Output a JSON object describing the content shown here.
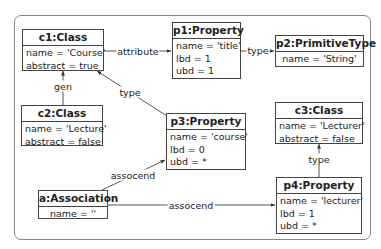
{
  "diagram": {
    "nodes": [
      {
        "id": "c1",
        "title": "c1:Class",
        "attrs": [
          "name = 'Course'",
          "abstract = true"
        ]
      },
      {
        "id": "p1",
        "title": "p1:Property",
        "attrs": [
          "name = 'title'",
          "lbd = 1",
          "ubd = 1"
        ]
      },
      {
        "id": "p2",
        "title": "p2:PrimitiveType",
        "attrs": [
          "name = 'String'"
        ]
      },
      {
        "id": "c2",
        "title": "c2:Class",
        "attrs": [
          "name = 'Lecture'",
          "abstract = false"
        ]
      },
      {
        "id": "p3",
        "title": "p3:Property",
        "attrs": [
          "name = 'course'",
          "lbd = 0",
          "ubd = *"
        ]
      },
      {
        "id": "c3",
        "title": "c3:Class",
        "attrs": [
          "name = 'Lecturer'",
          "abstract = false"
        ]
      },
      {
        "id": "a",
        "title": "a:Association",
        "attrs": [
          "name = ''"
        ]
      },
      {
        "id": "p4",
        "title": "p4:Property",
        "attrs": [
          "name = 'lecturer'",
          "lbd = 1",
          "ubd = *"
        ]
      }
    ],
    "edges": [
      {
        "from": "c1",
        "to": "p1",
        "label": "attribute"
      },
      {
        "from": "p1",
        "to": "p2",
        "label": "type"
      },
      {
        "from": "c2",
        "to": "c1",
        "label": "gen"
      },
      {
        "from": "p3",
        "to": "c1",
        "label": "type"
      },
      {
        "from": "a",
        "to": "p3",
        "label": "assocend"
      },
      {
        "from": "a",
        "to": "p4",
        "label": "assocend"
      },
      {
        "from": "p4",
        "to": "c3",
        "label": "type"
      }
    ]
  }
}
